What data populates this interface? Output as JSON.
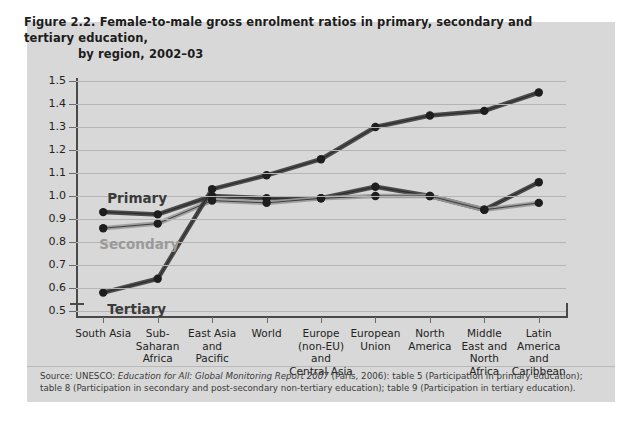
{
  "figure": {
    "title_line1": "Figure 2.2.  Female-to-male gross enrolment ratios in primary, secondary and tertiary education,",
    "title_line2": "by region, 2002–03",
    "source_prefix": "Source: UNESCO: ",
    "source_italic": "Education for All: Global Monitoring Report 2007",
    "source_suffix": " (Paris, 2006): table 5 (Participation in primary education); table 8 (Participation in secondary and post-secondary non-tertiary education); table 9 (Participation in tertiary education)."
  },
  "colors": {
    "panel_background": "#d8d8d8",
    "gridline": "#b4b4b4",
    "axis": "#4a4a4a",
    "primary_series": "#3b3b3b",
    "secondary_series": "#9a9a9a",
    "tertiary_series": "#3b3b3b",
    "marker": "#1e1e1e"
  },
  "chart_data": {
    "type": "line",
    "title": "Figure 2.2. Female-to-male gross enrolment ratios in primary, secondary and tertiary education, by region, 2002–03",
    "xlabel": "",
    "ylabel": "",
    "ylim": [
      0.5,
      1.5
    ],
    "yticks": [
      "1.5",
      "1.4",
      "1.3",
      "1.2",
      "1.1",
      "1.0",
      "0.9",
      "0.8",
      "0.7",
      "0.6",
      "0.5"
    ],
    "ytick_values": [
      1.5,
      1.4,
      1.3,
      1.2,
      1.1,
      1.0,
      0.9,
      0.8,
      0.7,
      0.6,
      0.5
    ],
    "grid": true,
    "legend_position": "inline-labels",
    "categories": [
      "South Asia",
      "Sub-\nSaharan\nAfrica",
      "East Asia\nand\nPacific",
      "World",
      "Europe\n(non-EU)\nand\nCentral Asia",
      "European\nUnion",
      "North\nAmerica",
      "Middle\nEast and\nNorth\nAfrica",
      "Latin\nAmerica\nand\nCaribbean"
    ],
    "categories_flat": [
      "South Asia",
      "Sub-Saharan Africa",
      "East Asia and Pacific",
      "World",
      "Europe (non-EU) and Central Asia",
      "European Union",
      "North America",
      "Middle East and North Africa",
      "Latin America and Caribbean"
    ],
    "series": [
      {
        "name": "Primary",
        "label": "Primary",
        "color": "#3b3b3b",
        "values": [
          0.93,
          0.92,
          1.0,
          0.99,
          0.99,
          1.04,
          1.0,
          0.94,
          1.06
        ]
      },
      {
        "name": "Secondary",
        "label": "Secondary",
        "color": "#9a9a9a",
        "values": [
          0.86,
          0.88,
          0.98,
          0.97,
          0.99,
          1.0,
          1.0,
          0.94,
          0.97
        ]
      },
      {
        "name": "Tertiary",
        "label": "Tertiary",
        "color": "#3b3b3b",
        "values": [
          0.58,
          0.64,
          1.03,
          1.09,
          1.16,
          1.3,
          1.35,
          1.37,
          1.45
        ]
      }
    ]
  }
}
